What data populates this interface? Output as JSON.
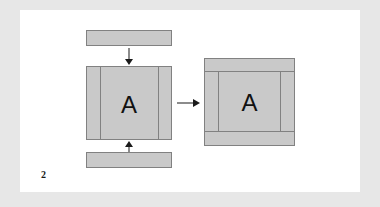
{
  "figure": {
    "number_label": "2",
    "background_color": "#e7e7e7",
    "paper_color": "#ffffff",
    "part_fill_color": "#c9c9c9",
    "part_stroke_color": "#818181",
    "arrow_color": "#1a1a1a"
  },
  "parts": {
    "rail_top": {
      "name": "top rail",
      "label": ""
    },
    "rail_bottom": {
      "name": "bottom rail",
      "label": ""
    },
    "center_panel": {
      "name": "center stile assembly",
      "label": "A"
    },
    "right_panel": {
      "name": "completed frame assembly",
      "label": "A"
    }
  },
  "arrows": {
    "down": {
      "direction": "down",
      "label": ""
    },
    "up": {
      "direction": "up",
      "label": ""
    },
    "right": {
      "direction": "right",
      "label": ""
    }
  }
}
